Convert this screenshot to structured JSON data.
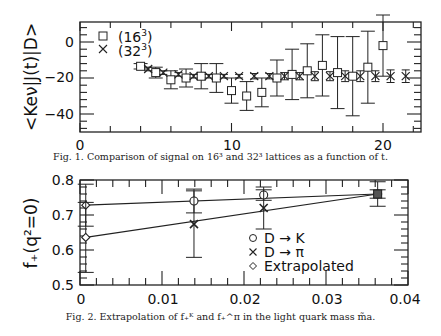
{
  "chart_data": [
    {
      "type": "scatter",
      "title": "",
      "xlabel": "t",
      "ylabel": "<Keν|J(t)|D>",
      "xlim": [
        0,
        22.5
      ],
      "ylim": [
        -50,
        11
      ],
      "xticks": [
        "0",
        "10",
        "20"
      ],
      "yticks": [
        "0",
        "-20",
        "-40"
      ],
      "grid": false,
      "legend_position": "upper-left",
      "series": [
        {
          "name": "(16^3)",
          "marker": "square",
          "x": [
            4,
            5,
            6,
            7,
            8,
            9,
            10,
            11,
            12,
            13,
            14,
            15,
            16,
            17,
            18,
            19,
            20
          ],
          "y": [
            -13.5,
            -17,
            -21,
            -20,
            -19,
            -20,
            -27,
            -30,
            -28,
            -20,
            -18,
            -16,
            -13,
            -17,
            -19,
            -14,
            -2
          ],
          "err": [
            1.5,
            3,
            5,
            5,
            7,
            8,
            7,
            8,
            8,
            10,
            14,
            15,
            17,
            20,
            22,
            20,
            17
          ]
        },
        {
          "name": "(32^3)",
          "marker": "cross",
          "x": [
            4.5,
            5.5,
            6.5,
            7.5,
            8.5,
            9.5,
            10.5,
            11.5,
            12.5,
            13.5,
            14.5,
            15.5,
            16.5,
            17.5,
            18.5,
            19.5,
            20.5,
            21.5
          ],
          "y": [
            -15,
            -17,
            -18,
            -19,
            -19,
            -19,
            -19,
            -19,
            -19,
            -19,
            -19,
            -19,
            -19,
            -19,
            -19,
            -19,
            -19,
            -19
          ],
          "err": [
            1,
            1,
            1,
            1,
            1,
            1,
            1,
            1.5,
            1.5,
            2,
            2,
            2.5,
            2.5,
            3,
            3,
            3,
            3.5,
            3.5
          ]
        }
      ],
      "caption": "Fig. 1. Comparison of signal on 16³ and 32³ lattices as a function of t."
    },
    {
      "type": "scatter",
      "title": "",
      "xlabel": "",
      "ylabel": "f+(q²=0)",
      "xlim": [
        0,
        0.04
      ],
      "ylim": [
        0.5,
        0.8
      ],
      "xticks": [
        "0",
        "0.01",
        "0.02",
        "0.03",
        "0.04"
      ],
      "yticks": [
        "0.5",
        "0.6",
        "0.7",
        "0.8"
      ],
      "grid": false,
      "legend_position": "lower-center",
      "series": [
        {
          "name": "D → K",
          "marker": "circle",
          "x": [
            0.0139,
            0.0224,
            0.0363
          ],
          "y": [
            0.74,
            0.757,
            0.76
          ],
          "err": [
            0.034,
            0.015,
            0.012
          ]
        },
        {
          "name": "D → π",
          "marker": "cross",
          "x": [
            0.0139,
            0.0224,
            0.0363
          ],
          "y": [
            0.674,
            0.72,
            0.76
          ],
          "err": [
            0.095,
            0.06,
            0.035
          ]
        },
        {
          "name": "Extrapolated",
          "marker": "diamond",
          "x": [
            0.0007,
            0.0007
          ],
          "y": [
            0.728,
            0.636
          ],
          "err": [
            0.06,
            0.1
          ]
        }
      ],
      "fit_lines": [
        {
          "name": "D → K fit",
          "x": [
            0.0007,
            0.0363
          ],
          "y": [
            0.728,
            0.76
          ]
        },
        {
          "name": "D → π fit",
          "x": [
            0.0007,
            0.0363
          ],
          "y": [
            0.636,
            0.76
          ]
        }
      ],
      "caption": "Fig. 2. Extrapolation of f+^K and f+^π in the light quark mass m̃a."
    }
  ],
  "fig1": {
    "ylabel": "<Keν|J(t)|D>",
    "xticks": [
      "0",
      "10",
      "20"
    ],
    "yticks": [
      "0",
      "−20",
      "−40"
    ],
    "legend": [
      {
        "symbol": "□",
        "label": "(16",
        "sup": "3",
        "close": ")"
      },
      {
        "symbol": "×",
        "label": "(32",
        "sup": "3",
        "close": ")"
      }
    ],
    "caption": "Fig. 1. Comparison of signal on 16³ and 32³ lattices as a function of t."
  },
  "fig2": {
    "ylabel": "f₊(q²=0)",
    "xticks": [
      "0",
      "0.01",
      "0.02",
      "0.03",
      "0.04"
    ],
    "yticks": [
      "0.5",
      "0.6",
      "0.7",
      "0.8"
    ],
    "legend": [
      {
        "symbol": "○",
        "label": "D → K"
      },
      {
        "symbol": "×",
        "label": "D → π"
      },
      {
        "symbol": "◇",
        "label": "Extrapolated"
      }
    ],
    "caption": "Fig. 2. Extrapolation of f₊ᴷ and f₊^π in the light quark mass m̃a."
  }
}
